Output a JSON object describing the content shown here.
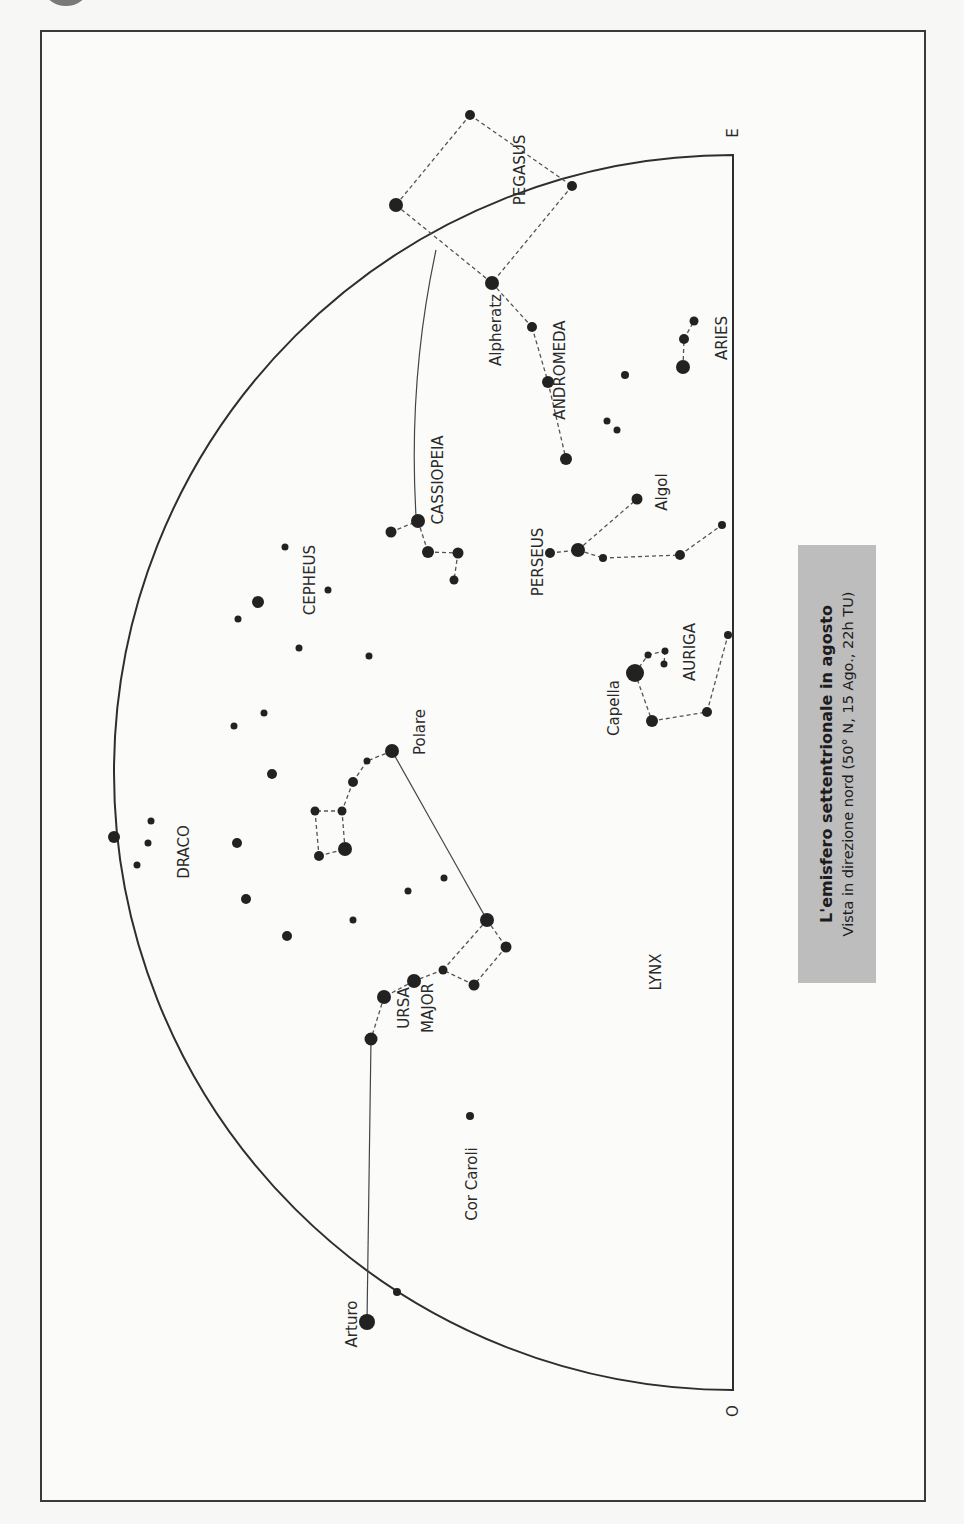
{
  "chart": {
    "title": "L'emisfero settentrionale in agosto",
    "subtitle": "Vista in direzione nord (50° N, 15 Ago., 22h TU)",
    "directions": {
      "east": "E",
      "west": "O"
    }
  },
  "constellations": [
    {
      "name": "PEGASUS",
      "x": 520,
      "y": 170
    },
    {
      "name": "ANDROMEDA",
      "x": 560,
      "y": 370
    },
    {
      "name": "ARIES",
      "x": 722,
      "y": 338
    },
    {
      "name": "CASSIOPEIA",
      "x": 438,
      "y": 480
    },
    {
      "name": "PERSEUS",
      "x": 538,
      "y": 562
    },
    {
      "name": "CEPHEUS",
      "x": 310,
      "y": 580
    },
    {
      "name": "AURIGA",
      "x": 690,
      "y": 652
    },
    {
      "name": "DRACO",
      "x": 184,
      "y": 852
    },
    {
      "name": "URSA",
      "x": 404,
      "y": 1008
    },
    {
      "name": "MAJOR",
      "x": 428,
      "y": 1008
    },
    {
      "name": "LYNX",
      "x": 656,
      "y": 972
    }
  ],
  "star_labels": [
    {
      "name": "Alpheratz",
      "x": 496,
      "y": 330
    },
    {
      "name": "Algol",
      "x": 662,
      "y": 492
    },
    {
      "name": "Capella",
      "x": 614,
      "y": 708
    },
    {
      "name": "Polare",
      "x": 420,
      "y": 732
    },
    {
      "name": "Cor Caroli",
      "x": 472,
      "y": 1184
    },
    {
      "name": "Arturo",
      "x": 352,
      "y": 1324
    }
  ],
  "stars": [
    {
      "x": 470,
      "y": 115,
      "r": 5
    },
    {
      "x": 396,
      "y": 205,
      "r": 7
    },
    {
      "x": 572,
      "y": 186,
      "r": 5
    },
    {
      "x": 492,
      "y": 283,
      "r": 7
    },
    {
      "x": 532,
      "y": 327,
      "r": 5
    },
    {
      "x": 548,
      "y": 382,
      "r": 6
    },
    {
      "x": 566,
      "y": 459,
      "r": 6
    },
    {
      "x": 625,
      "y": 375,
      "r": 4
    },
    {
      "x": 607,
      "y": 421,
      "r": 3.5
    },
    {
      "x": 617,
      "y": 430,
      "r": 3.5
    },
    {
      "x": 694,
      "y": 321,
      "r": 4.5
    },
    {
      "x": 684,
      "y": 339,
      "r": 5
    },
    {
      "x": 683,
      "y": 367,
      "r": 7
    },
    {
      "x": 418,
      "y": 521,
      "r": 7
    },
    {
      "x": 391,
      "y": 532,
      "r": 5.5
    },
    {
      "x": 428,
      "y": 552,
      "r": 6
    },
    {
      "x": 458,
      "y": 553,
      "r": 5.5
    },
    {
      "x": 454,
      "y": 580,
      "r": 4.5
    },
    {
      "x": 637,
      "y": 499,
      "r": 5.5
    },
    {
      "x": 578,
      "y": 550,
      "r": 7
    },
    {
      "x": 550,
      "y": 553,
      "r": 5
    },
    {
      "x": 603,
      "y": 558,
      "r": 4
    },
    {
      "x": 680,
      "y": 555,
      "r": 5
    },
    {
      "x": 722,
      "y": 525,
      "r": 4
    },
    {
      "x": 285,
      "y": 547,
      "r": 3.5
    },
    {
      "x": 258,
      "y": 602,
      "r": 6
    },
    {
      "x": 328,
      "y": 590,
      "r": 3.5
    },
    {
      "x": 238,
      "y": 619,
      "r": 3.5
    },
    {
      "x": 299,
      "y": 648,
      "r": 3.5
    },
    {
      "x": 369,
      "y": 656,
      "r": 3.5
    },
    {
      "x": 264,
      "y": 713,
      "r": 3.5
    },
    {
      "x": 234,
      "y": 726,
      "r": 3.5
    },
    {
      "x": 272,
      "y": 774,
      "r": 5
    },
    {
      "x": 635,
      "y": 673,
      "r": 9
    },
    {
      "x": 648,
      "y": 655,
      "r": 3.5
    },
    {
      "x": 665,
      "y": 651,
      "r": 3.5
    },
    {
      "x": 664,
      "y": 664,
      "r": 3.5
    },
    {
      "x": 652,
      "y": 721,
      "r": 6
    },
    {
      "x": 707,
      "y": 712,
      "r": 5
    },
    {
      "x": 728,
      "y": 635,
      "r": 4
    },
    {
      "x": 392,
      "y": 751,
      "r": 7
    },
    {
      "x": 367,
      "y": 761,
      "r": 3.5
    },
    {
      "x": 353,
      "y": 782,
      "r": 5
    },
    {
      "x": 342,
      "y": 811,
      "r": 4.5
    },
    {
      "x": 315,
      "y": 811,
      "r": 4.5
    },
    {
      "x": 319,
      "y": 856,
      "r": 5
    },
    {
      "x": 345,
      "y": 849,
      "r": 7
    },
    {
      "x": 114,
      "y": 837,
      "r": 6
    },
    {
      "x": 151,
      "y": 821,
      "r": 3.5
    },
    {
      "x": 148,
      "y": 843,
      "r": 3.5
    },
    {
      "x": 137,
      "y": 865,
      "r": 3.5
    },
    {
      "x": 237,
      "y": 843,
      "r": 5
    },
    {
      "x": 246,
      "y": 899,
      "r": 5
    },
    {
      "x": 287,
      "y": 936,
      "r": 5
    },
    {
      "x": 408,
      "y": 891,
      "r": 3.5
    },
    {
      "x": 444,
      "y": 878,
      "r": 3.5
    },
    {
      "x": 353,
      "y": 920,
      "r": 3.5
    },
    {
      "x": 487,
      "y": 920,
      "r": 7
    },
    {
      "x": 506,
      "y": 947,
      "r": 5.5
    },
    {
      "x": 443,
      "y": 970,
      "r": 4.5
    },
    {
      "x": 474,
      "y": 985,
      "r": 5.5
    },
    {
      "x": 414,
      "y": 981,
      "r": 7
    },
    {
      "x": 384,
      "y": 997,
      "r": 7
    },
    {
      "x": 371,
      "y": 1039,
      "r": 6.5
    },
    {
      "x": 470,
      "y": 1116,
      "r": 4
    },
    {
      "x": 397,
      "y": 1292,
      "r": 4
    },
    {
      "x": 367,
      "y": 1322,
      "r": 8
    }
  ],
  "dashed_links": [
    [
      [
        470,
        115
      ],
      [
        396,
        205
      ]
    ],
    [
      [
        470,
        115
      ],
      [
        572,
        186
      ]
    ],
    [
      [
        396,
        205
      ],
      [
        492,
        283
      ]
    ],
    [
      [
        572,
        186
      ],
      [
        492,
        283
      ]
    ],
    [
      [
        492,
        283
      ],
      [
        532,
        327
      ]
    ],
    [
      [
        532,
        327
      ],
      [
        548,
        382
      ]
    ],
    [
      [
        548,
        382
      ],
      [
        566,
        459
      ]
    ],
    [
      [
        684,
        339
      ],
      [
        694,
        321
      ]
    ],
    [
      [
        683,
        367
      ],
      [
        684,
        339
      ]
    ],
    [
      [
        391,
        532
      ],
      [
        418,
        521
      ]
    ],
    [
      [
        418,
        521
      ],
      [
        428,
        552
      ]
    ],
    [
      [
        428,
        552
      ],
      [
        458,
        553
      ]
    ],
    [
      [
        458,
        553
      ],
      [
        454,
        580
      ]
    ],
    [
      [
        550,
        553
      ],
      [
        578,
        550
      ]
    ],
    [
      [
        578,
        550
      ],
      [
        637,
        499
      ]
    ],
    [
      [
        578,
        550
      ],
      [
        603,
        558
      ]
    ],
    [
      [
        603,
        558
      ],
      [
        680,
        555
      ]
    ],
    [
      [
        680,
        555
      ],
      [
        722,
        525
      ]
    ],
    [
      [
        635,
        673
      ],
      [
        648,
        655
      ]
    ],
    [
      [
        648,
        655
      ],
      [
        665,
        651
      ]
    ],
    [
      [
        665,
        651
      ],
      [
        664,
        664
      ]
    ],
    [
      [
        635,
        673
      ],
      [
        652,
        721
      ]
    ],
    [
      [
        652,
        721
      ],
      [
        707,
        712
      ]
    ],
    [
      [
        707,
        712
      ],
      [
        728,
        635
      ]
    ],
    [
      [
        392,
        751
      ],
      [
        367,
        761
      ]
    ],
    [
      [
        367,
        761
      ],
      [
        353,
        782
      ]
    ],
    [
      [
        353,
        782
      ],
      [
        342,
        811
      ]
    ],
    [
      [
        342,
        811
      ],
      [
        315,
        811
      ]
    ],
    [
      [
        315,
        811
      ],
      [
        319,
        856
      ]
    ],
    [
      [
        319,
        856
      ],
      [
        345,
        849
      ]
    ],
    [
      [
        345,
        849
      ],
      [
        342,
        811
      ]
    ],
    [
      [
        487,
        920
      ],
      [
        506,
        947
      ]
    ],
    [
      [
        506,
        947
      ],
      [
        474,
        985
      ]
    ],
    [
      [
        474,
        985
      ],
      [
        443,
        970
      ]
    ],
    [
      [
        443,
        970
      ],
      [
        487,
        920
      ]
    ],
    [
      [
        443,
        970
      ],
      [
        414,
        981
      ]
    ],
    [
      [
        414,
        981
      ],
      [
        384,
        997
      ]
    ],
    [
      [
        384,
        997
      ],
      [
        371,
        1039
      ]
    ]
  ],
  "solid_links": [
    [
      [
        392,
        751
      ],
      [
        487,
        920
      ]
    ],
    [
      [
        371,
        1039
      ],
      [
        367,
        1322
      ]
    ]
  ],
  "horizon": {
    "flat_x": 733,
    "top_y": 155,
    "bottom_y": 1390,
    "apex_x": 114
  }
}
